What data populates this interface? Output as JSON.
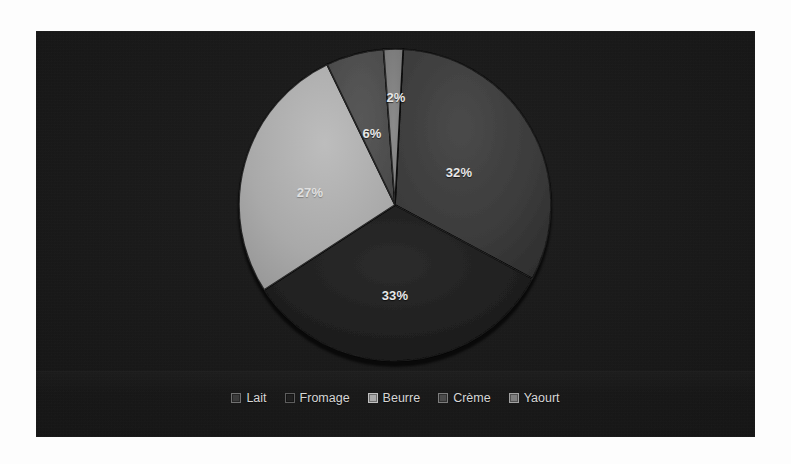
{
  "chart_data": {
    "type": "pie",
    "title": "",
    "subtitle": "",
    "categories": [
      "Lait",
      "Fromage",
      "Beurre",
      "Crème",
      "Yaourt"
    ],
    "values": [
      32,
      33,
      27,
      6,
      2
    ],
    "labels": [
      "32%",
      "33%",
      "27%",
      "6%",
      "2%"
    ],
    "units": "%",
    "legend_position": "bottom",
    "grid": false,
    "three_d": true,
    "start_angle_deg": 3,
    "slices": [
      {
        "name": "Lait",
        "label": "32%",
        "value": 32,
        "color": "#3b3b3b",
        "start_deg": 3,
        "sweep_deg": 115.2,
        "label_x": 459,
        "label_y": 172
      },
      {
        "name": "Fromage",
        "label": "33%",
        "value": 33,
        "color": "#1f1f1f",
        "start_deg": 118.2,
        "sweep_deg": 118.8,
        "label_x": 395,
        "label_y": 295
      },
      {
        "name": "Beurre",
        "label": "27%",
        "value": 27,
        "color": "#a9a9a9",
        "start_deg": 237.0,
        "sweep_deg": 97.2,
        "label_x": 310,
        "label_y": 192
      },
      {
        "name": "Crème",
        "label": "6%",
        "value": 6,
        "color": "#4c4c4c",
        "start_deg": 334.2,
        "sweep_deg": 21.6,
        "label_x": 372,
        "label_y": 133
      },
      {
        "name": "Yaourt",
        "label": "2%",
        "value": 2,
        "color": "#7e7e7e",
        "start_deg": 355.8,
        "sweep_deg": 7.2,
        "label_x": 396,
        "label_y": 97
      }
    ]
  },
  "legend": {
    "items": [
      {
        "label": "Lait",
        "color": "#3b3b3b"
      },
      {
        "label": "Fromage",
        "color": "#1f1f1f"
      },
      {
        "label": "Beurre",
        "color": "#a9a9a9"
      },
      {
        "label": "Crème",
        "color": "#4c4c4c"
      },
      {
        "label": "Yaourt",
        "color": "#7e7e7e"
      }
    ]
  },
  "theme": {
    "page_background": "#fdfdfd",
    "plot_background": "#151515",
    "label_color": "#e8e8e8",
    "legend_text_color": "#d6d6d6"
  }
}
